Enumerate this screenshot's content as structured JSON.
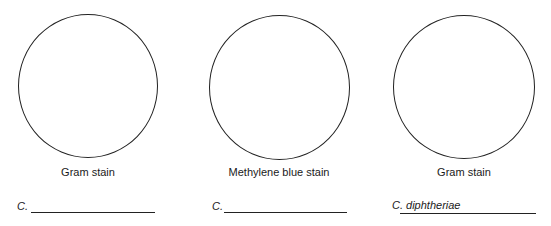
{
  "panels": [
    {
      "stain_label": "Gram stain",
      "organism_prefix": "C.",
      "organism_answer": ""
    },
    {
      "stain_label": "Methylene blue stain",
      "organism_prefix": "C.",
      "organism_answer": ""
    },
    {
      "stain_label": "Gram stain",
      "organism_prefix": "C. diphtheriae",
      "organism_answer": ""
    }
  ]
}
